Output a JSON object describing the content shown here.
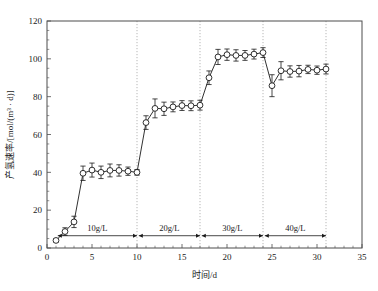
{
  "chart_data": {
    "type": "line",
    "title": "",
    "xlabel": "时间/d",
    "ylabel": "产氢速率/[mol/(m³ · d)]",
    "xlim": [
      0,
      35
    ],
    "ylim": [
      0,
      120
    ],
    "x_major_ticks": [
      0,
      5,
      10,
      15,
      20,
      25,
      30,
      35
    ],
    "y_major_ticks": [
      0,
      20,
      40,
      60,
      80,
      100,
      120
    ],
    "x_minor_step": 1,
    "y_minor_step": 5,
    "grid": "vertical dotted gridlines at phase boundaries x = 10, 17, 24, 31",
    "legend": "none",
    "marker": "open circle",
    "error_bars": "symmetric vertical",
    "series": [
      {
        "name": "产氢速率",
        "x": [
          1,
          2,
          3,
          4,
          5,
          6,
          7,
          8,
          9,
          10,
          11,
          12,
          13,
          14,
          15,
          16,
          17,
          18,
          19,
          20,
          21,
          22,
          23,
          24,
          25,
          26,
          27,
          28,
          29,
          30,
          31
        ],
        "values": [
          4.0,
          8.7,
          13.8,
          39.5,
          41.2,
          40.0,
          41.0,
          41.0,
          40.6,
          40.0,
          66.3,
          73.8,
          73.6,
          74.6,
          75.3,
          75.2,
          75.5,
          90.0,
          101.0,
          102.2,
          101.8,
          101.8,
          102.5,
          103.3,
          85.8,
          93.7,
          93.3,
          93.5,
          94.4,
          94.0,
          94.6
        ],
        "yerr": [
          1.0,
          2.0,
          3.0,
          3.8,
          3.7,
          3.3,
          3.4,
          3.0,
          2.2,
          1.5,
          3.6,
          5.0,
          3.5,
          2.6,
          2.6,
          2.6,
          2.6,
          3.6,
          4.0,
          3.0,
          3.0,
          2.6,
          2.6,
          2.6,
          5.8,
          4.8,
          3.0,
          3.0,
          2.2,
          2.2,
          2.6
        ]
      }
    ],
    "annotations": [
      {
        "label": "10g/L",
        "x_start": 1.2,
        "x_end": 10.0,
        "y": 6.5,
        "label_x": 5.6
      },
      {
        "label": "20g/L",
        "x_start": 10.2,
        "x_end": 17.0,
        "y": 6.5,
        "label_x": 13.6
      },
      {
        "label": "30g/L",
        "x_start": 17.2,
        "x_end": 24.0,
        "y": 6.5,
        "label_x": 20.6
      },
      {
        "label": "40g/L",
        "x_start": 24.2,
        "x_end": 31.0,
        "y": 6.5,
        "label_x": 27.6
      }
    ],
    "phase_boundaries": [
      10,
      17,
      24,
      31
    ]
  }
}
